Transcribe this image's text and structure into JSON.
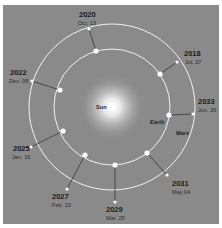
{
  "diagram": {
    "title": "",
    "colors": {
      "background": "#8a8a8a",
      "orbit": "#f2f2f2",
      "connector": "#2b2b2b",
      "sun": "#ffffff"
    },
    "bodies": {
      "sun": "Sun",
      "earth": "Earth",
      "mars": "Mars"
    },
    "oppositions": [
      {
        "year": "2018",
        "date": "Jul. 27"
      },
      {
        "year": "2020",
        "date": "Oct. 13"
      },
      {
        "year": "2022",
        "date": "Dec. 08"
      },
      {
        "year": "2025",
        "date": "Jan. 16"
      },
      {
        "year": "2027",
        "date": "Feb. 19"
      },
      {
        "year": "2029",
        "date": "Mar. 25"
      },
      {
        "year": "2031",
        "date": "May 04"
      },
      {
        "year": "2033",
        "date": "Jun. 26"
      }
    ]
  }
}
